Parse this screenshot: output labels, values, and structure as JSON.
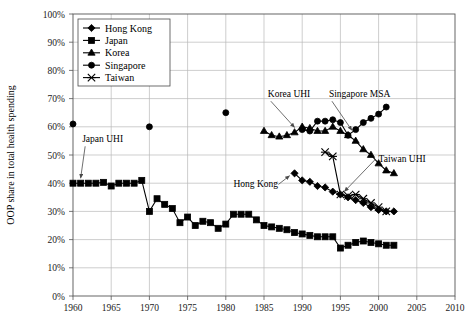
{
  "chart_data": {
    "type": "line",
    "title": "",
    "xlabel": "",
    "ylabel": "OOP share in total health spending",
    "xlim": [
      1960,
      2010
    ],
    "ylim": [
      0,
      100
    ],
    "xticks": [
      1960,
      1965,
      1970,
      1975,
      1980,
      1985,
      1990,
      1995,
      2000,
      2005,
      2010
    ],
    "xtick_labels": [
      "1960",
      "1965",
      "1970",
      "1975",
      "1980",
      "1985",
      "1990",
      "1995",
      "2000",
      "2005",
      "2010"
    ],
    "yticks": [
      0,
      10,
      20,
      30,
      40,
      50,
      60,
      70,
      80,
      90,
      100
    ],
    "ytick_labels": [
      "0%",
      "10%",
      "20%",
      "30%",
      "40%",
      "50%",
      "60%",
      "70%",
      "80%",
      "90%",
      "100%"
    ],
    "grid": true,
    "legend_position": "top-left",
    "units": "percent",
    "series": [
      {
        "name": "Hong Kong",
        "marker": "diamond",
        "x": [
          1989,
          1990,
          1991,
          1992,
          1993,
          1994,
          1995,
          1996,
          1997,
          1998,
          1999,
          2000,
          2001,
          2002
        ],
        "values": [
          43.5,
          41.0,
          40.5,
          39.0,
          38.5,
          37.0,
          36.0,
          35.0,
          34.0,
          33.0,
          31.5,
          30.5,
          30.0,
          30.0
        ]
      },
      {
        "name": "Japan",
        "marker": "square",
        "x": [
          1960,
          1961,
          1962,
          1963,
          1964,
          1965,
          1966,
          1967,
          1968,
          1969,
          1970,
          1971,
          1972,
          1973,
          1974,
          1975,
          1976,
          1977,
          1978,
          1979,
          1980,
          1981,
          1982,
          1983,
          1984,
          1985,
          1986,
          1987,
          1988,
          1989,
          1990,
          1991,
          1992,
          1993,
          1994,
          1995,
          1996,
          1997,
          1998,
          1999,
          2000,
          2001,
          2002
        ],
        "values": [
          40.0,
          40.0,
          40.0,
          40.0,
          40.3,
          39.0,
          40.0,
          40.0,
          40.0,
          41.0,
          30.0,
          34.5,
          32.5,
          31.0,
          26.0,
          28.0,
          25.0,
          26.5,
          26.0,
          24.0,
          25.5,
          29.0,
          29.0,
          29.0,
          27.0,
          25.0,
          24.5,
          24.0,
          23.5,
          22.5,
          22.0,
          21.5,
          21.0,
          21.0,
          21.0,
          17.0,
          18.0,
          19.0,
          19.5,
          19.0,
          18.5,
          18.0,
          18.0
        ]
      },
      {
        "name": "Korea",
        "marker": "triangle",
        "x": [
          1985,
          1986,
          1987,
          1988,
          1989,
          1990,
          1991,
          1992,
          1993,
          1994,
          1995,
          1996,
          1997,
          1998,
          1999,
          2000,
          2001,
          2002
        ],
        "values": [
          58.5,
          57.0,
          56.5,
          57.0,
          58.0,
          60.0,
          59.5,
          58.5,
          58.5,
          60.0,
          58.5,
          57.0,
          55.0,
          52.0,
          50.0,
          47.0,
          44.5,
          43.5
        ]
      },
      {
        "name": "Singapore",
        "marker": "circle",
        "x": [
          1960,
          1970,
          1980,
          1990,
          1991,
          1992,
          1993,
          1994,
          1995,
          1996,
          1997,
          1998,
          1999,
          2000,
          2001
        ],
        "values": [
          61.0,
          60.0,
          65.0,
          59.0,
          58.5,
          62.0,
          62.0,
          62.5,
          61.5,
          57.0,
          59.0,
          61.5,
          63.0,
          64.5,
          67.0
        ]
      },
      {
        "name": "Taiwan",
        "marker": "x",
        "x": [
          1993,
          1994,
          1995,
          1996,
          1997,
          1998,
          1999,
          2000,
          2001
        ],
        "values": [
          51.0,
          49.5,
          36.0,
          35.5,
          36.0,
          34.5,
          33.0,
          31.5,
          30.0
        ]
      }
    ],
    "annotations": [
      {
        "label": "Japan UHI",
        "x": 1961,
        "y": 40,
        "text_x": 1961.2,
        "text_y": 54.5,
        "kind": "arrow-down"
      },
      {
        "label": "Korea UHI",
        "x": 1989,
        "y": 58,
        "text_x": 1985.5,
        "text_y": 70.5,
        "kind": "arrow-down"
      },
      {
        "label": "Singapore MSA",
        "x": 1996.5,
        "y": 57,
        "text_x": 1993.5,
        "text_y": 70.5,
        "kind": "arrow-down"
      },
      {
        "label": "Taiwan UHI",
        "x": 1995,
        "y": 36,
        "text_x": 2000.0,
        "text_y": 47.5,
        "kind": "leader"
      },
      {
        "label": "Hong Kong",
        "x": 1989,
        "y": 43,
        "text_x": 1981.0,
        "text_y": 38.5,
        "kind": "arrow-right"
      }
    ]
  },
  "legend": {
    "entries": [
      "Hong Kong",
      "Japan",
      "Korea",
      "Singapore",
      "Taiwan"
    ]
  }
}
